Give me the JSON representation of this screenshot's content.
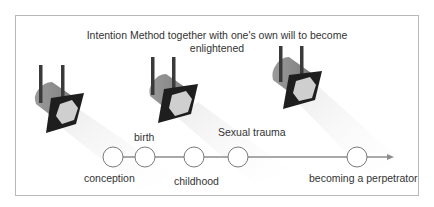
{
  "title": {
    "line1": "Intention Method together with one's own will to become",
    "line2": "enlightened"
  },
  "spotlights": [
    {
      "name": "spotlight-1",
      "icon": "spotlight-icon"
    },
    {
      "name": "spotlight-2",
      "icon": "spotlight-icon"
    },
    {
      "name": "spotlight-3",
      "icon": "spotlight-icon"
    }
  ],
  "timeline": {
    "stages": [
      {
        "label": "conception",
        "position": "below"
      },
      {
        "label": "birth",
        "position": "above"
      },
      {
        "label": "childhood",
        "position": "below"
      },
      {
        "label": "Sexual trauma",
        "position": "above"
      },
      {
        "label": "becoming a perpetrator",
        "position": "below"
      }
    ]
  },
  "colors": {
    "frame_border": "#b8b8b8",
    "post": "#3a3a3a",
    "body": "#8a8a8a",
    "front_plate": "#1e1e1e",
    "lens": "#cfcfcf",
    "beam": "#f2f2f2",
    "timeline_line": "#8c8c8c",
    "node_stroke": "#7a7a7a"
  }
}
